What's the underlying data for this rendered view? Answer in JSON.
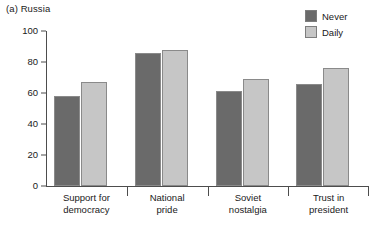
{
  "panel": {
    "title": "(a) Russia"
  },
  "legend": {
    "position": "top-right",
    "items": [
      {
        "label": "Never",
        "color": "#6a6a6a",
        "name": "never"
      },
      {
        "label": "Daily",
        "color": "#c6c6c6",
        "name": "daily"
      }
    ]
  },
  "chart_data": {
    "type": "bar",
    "title": "(a) Russia",
    "xlabel": "",
    "ylabel": "",
    "ylim": [
      0,
      100
    ],
    "yticks": [
      0,
      20,
      40,
      60,
      80,
      100
    ],
    "ytick_labels": [
      "0",
      "20",
      "40",
      "60",
      "80",
      "100"
    ],
    "grid": false,
    "legend_position": "top-right",
    "categories": [
      "Support for democracy",
      "National pride",
      "Soviet nostalgia",
      "Trust in president"
    ],
    "category_lines": [
      [
        "Support for",
        "democracy"
      ],
      [
        "National",
        "pride"
      ],
      [
        "Soviet",
        "nostalgia"
      ],
      [
        "Trust in",
        "president"
      ]
    ],
    "series": [
      {
        "name": "Never",
        "color": "#6a6a6a",
        "values": [
          58,
          86,
          61,
          66
        ]
      },
      {
        "name": "Daily",
        "color": "#c6c6c6",
        "values": [
          67,
          88,
          69,
          76
        ]
      }
    ]
  },
  "colors": {
    "never": "#6a6a6a",
    "daily": "#c6c6c6",
    "axis": "#4d4d4d",
    "bar_outline": "#8a8a8a",
    "background": "#ffffff"
  }
}
